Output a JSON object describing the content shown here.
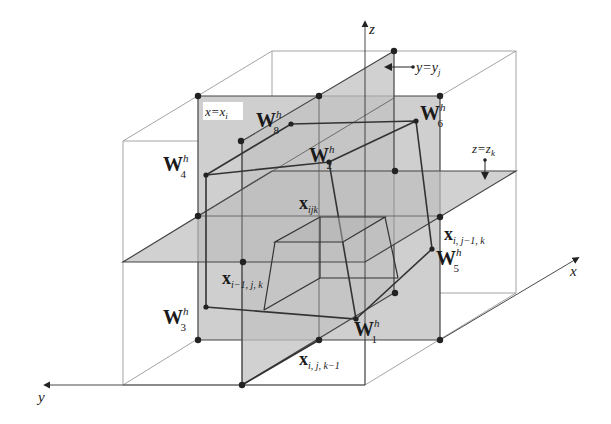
{
  "figure": {
    "type": "3d-grid-cell-diagram",
    "axes": {
      "x": "x",
      "y": "y",
      "z": "z"
    },
    "planes": {
      "x_plane": "x=x",
      "x_plane_sub": "i",
      "y_plane": "y=y",
      "y_plane_sub": "j",
      "z_plane": "z=z",
      "z_plane_sub": "k"
    },
    "vertices": [
      {
        "name": "W",
        "sup": "h",
        "sub": "1"
      },
      {
        "name": "W",
        "sup": "h",
        "sub": "2"
      },
      {
        "name": "W",
        "sup": "h",
        "sub": "3"
      },
      {
        "name": "W",
        "sup": "h",
        "sub": "4"
      },
      {
        "name": "W",
        "sup": "h",
        "sub": "5"
      },
      {
        "name": "W",
        "sup": "h",
        "sub": "6"
      },
      {
        "name": "W",
        "sup": "h",
        "sub": "8"
      }
    ],
    "nodes": [
      {
        "name": "x",
        "sub": "ijk"
      },
      {
        "name": "x",
        "sub": "i−1, j, k"
      },
      {
        "name": "x",
        "sub": "i, j−1, k"
      },
      {
        "name": "x",
        "sub": "i, j, k−1"
      }
    ],
    "colors": {
      "plane_fill": "#c8c8c8",
      "line": "#333333",
      "box_line": "#9a9a9a",
      "background": "#ffffff"
    }
  }
}
